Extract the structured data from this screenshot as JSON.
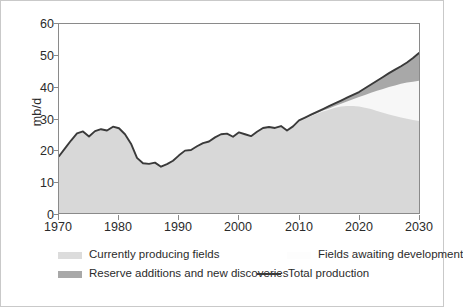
{
  "chart_data": {
    "type": "area",
    "title": "",
    "xlabel": "",
    "ylabel": "mb/d",
    "xlim": [
      1970,
      2030
    ],
    "ylim": [
      0,
      60
    ],
    "xticks": [
      1970,
      1980,
      1990,
      2000,
      2010,
      2020,
      2030
    ],
    "yticks": [
      0,
      10,
      20,
      30,
      40,
      50,
      60
    ],
    "grid": false,
    "legend_position": "below-plot",
    "colors": {
      "currently_producing_fields": "#d8d8d8",
      "fields_awaiting_development": "#f5f5f5",
      "reserve_additions_and_new_discoveries": "#a8a8a8",
      "total_production_line": "#3a3a3a",
      "axis": "#8a8a8a",
      "text": "#2b2b2b",
      "background": "#ffffff",
      "frame": "#c9c9c9"
    },
    "x": [
      1970,
      1971,
      1972,
      1973,
      1974,
      1975,
      1976,
      1977,
      1978,
      1979,
      1980,
      1981,
      1982,
      1983,
      1984,
      1985,
      1986,
      1987,
      1988,
      1989,
      1990,
      1991,
      1992,
      1993,
      1994,
      1995,
      1996,
      1997,
      1998,
      1999,
      2000,
      2001,
      2002,
      2003,
      2004,
      2005,
      2006,
      2007,
      2008,
      2009,
      2010,
      2011,
      2012,
      2013,
      2014,
      2015,
      2016,
      2017,
      2018,
      2019,
      2020,
      2021,
      2022,
      2023,
      2024,
      2025,
      2026,
      2027,
      2028,
      2029,
      2030
    ],
    "series": [
      {
        "name": "Total production",
        "style": "line",
        "values": [
          18.0,
          20.5,
          23.0,
          25.3,
          25.9,
          24.3,
          26.0,
          26.6,
          26.2,
          27.4,
          26.9,
          25.0,
          22.0,
          17.5,
          15.8,
          15.6,
          16.0,
          14.7,
          15.5,
          16.6,
          18.3,
          19.8,
          20.0,
          21.2,
          22.2,
          22.7,
          24.0,
          25.0,
          25.2,
          24.2,
          25.6,
          25.0,
          24.4,
          25.8,
          27.0,
          27.3,
          27.0,
          27.6,
          26.2,
          27.5,
          29.4,
          30.3,
          31.2,
          32.1,
          33.0,
          33.9,
          34.8,
          35.7,
          36.6,
          37.5,
          38.4,
          39.6,
          40.8,
          42.0,
          43.2,
          44.4,
          45.5,
          46.6,
          47.8,
          49.2,
          50.8
        ]
      },
      {
        "name": "Currently producing fields",
        "style": "area",
        "values": [
          18.0,
          20.5,
          23.0,
          25.3,
          25.9,
          24.3,
          26.0,
          26.6,
          26.2,
          27.4,
          26.9,
          25.0,
          22.0,
          17.5,
          15.8,
          15.6,
          16.0,
          14.7,
          15.5,
          16.6,
          18.3,
          19.8,
          20.0,
          21.2,
          22.2,
          22.7,
          24.0,
          25.0,
          25.2,
          24.2,
          25.6,
          25.0,
          24.4,
          25.8,
          27.0,
          27.3,
          27.0,
          27.6,
          26.2,
          27.5,
          29.2,
          30.0,
          30.8,
          31.5,
          32.2,
          32.8,
          33.4,
          33.8,
          34.0,
          34.0,
          33.8,
          33.4,
          33.0,
          32.4,
          31.8,
          31.3,
          30.8,
          30.3,
          29.9,
          29.5,
          29.2
        ]
      },
      {
        "name": "Fields awaiting development",
        "style": "area",
        "values": [
          18.0,
          20.5,
          23.0,
          25.3,
          25.9,
          24.3,
          26.0,
          26.6,
          26.2,
          27.4,
          26.9,
          25.0,
          22.0,
          17.5,
          15.8,
          15.6,
          16.0,
          14.7,
          15.5,
          16.6,
          18.3,
          19.8,
          20.0,
          21.2,
          22.2,
          22.7,
          24.0,
          25.0,
          25.2,
          24.2,
          25.6,
          25.0,
          24.4,
          25.8,
          27.0,
          27.3,
          27.0,
          27.6,
          26.2,
          27.5,
          29.2,
          30.0,
          30.9,
          31.7,
          32.5,
          33.2,
          34.0,
          34.7,
          35.4,
          36.1,
          36.8,
          37.5,
          38.2,
          38.8,
          39.4,
          40.0,
          40.5,
          41.0,
          41.4,
          41.7,
          42.0
        ]
      },
      {
        "name": "Reserve additions and new discoveries",
        "style": "area",
        "values": [
          18.0,
          20.5,
          23.0,
          25.3,
          25.9,
          24.3,
          26.0,
          26.6,
          26.2,
          27.4,
          26.9,
          25.0,
          22.0,
          17.5,
          15.8,
          15.6,
          16.0,
          14.7,
          15.5,
          16.6,
          18.3,
          19.8,
          20.0,
          21.2,
          22.2,
          22.7,
          24.0,
          25.0,
          25.2,
          24.2,
          25.6,
          25.0,
          24.4,
          25.8,
          27.0,
          27.3,
          27.0,
          27.6,
          26.2,
          27.5,
          29.4,
          30.3,
          31.2,
          32.1,
          33.0,
          33.9,
          34.8,
          35.7,
          36.6,
          37.5,
          38.4,
          39.6,
          40.8,
          42.0,
          43.2,
          44.4,
          45.5,
          46.6,
          47.8,
          49.2,
          50.8
        ]
      }
    ]
  },
  "axis": {
    "ylabel": "mb/d",
    "ytick_labels": [
      "0",
      "10",
      "20",
      "30",
      "40",
      "50",
      "60"
    ],
    "xtick_labels": [
      "1970",
      "1980",
      "1990",
      "2000",
      "2010",
      "2020",
      "2030"
    ]
  },
  "legend": {
    "currently_producing": "Currently producing fields",
    "reserve_additions": "Reserve additions and new discoveries",
    "fields_awaiting": "Fields awaiting development",
    "total_production": "Total production"
  }
}
